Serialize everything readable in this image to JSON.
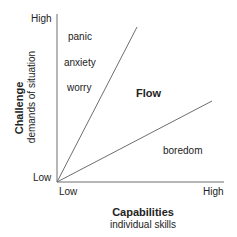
{
  "diagram": {
    "y_axis": {
      "title": "Challenge",
      "subtitle": "demands of situation",
      "high_label": "High",
      "low_label": "Low"
    },
    "x_axis": {
      "title": "Capabilities",
      "subtitle": "individual skills",
      "low_label": "Low",
      "high_label": "High"
    },
    "regions": {
      "upper": [
        "panic",
        "anxiety",
        "worry"
      ],
      "channel": "Flow",
      "lower": "boredom"
    },
    "colors": {
      "line": "#6e6e6e",
      "text": "#222222",
      "background": "#ffffff"
    }
  }
}
